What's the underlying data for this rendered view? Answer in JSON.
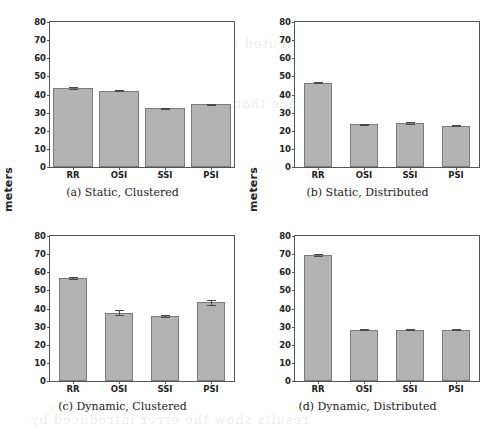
{
  "figure": {
    "ylabel": "meters",
    "yticks": [
      0,
      10,
      20,
      30,
      40,
      50,
      60,
      70,
      80
    ],
    "ylim": [
      0,
      80
    ],
    "categories": [
      "RR",
      "OSI",
      "SSI",
      "PSI"
    ],
    "bar_color": "#b3b3b3",
    "bar_edge_color": "#7a7a7a",
    "bleed_text": [
      "the distributed versions of the algorithms",
      "performance than the clustered variants",
      "results show the error introduced by"
    ]
  },
  "chart_data": [
    {
      "type": "bar",
      "panel": "a",
      "title": "(a) Static, Clustered",
      "categories": [
        "RR",
        "OSI",
        "SSI",
        "PSI"
      ],
      "values": [
        43.8,
        42.2,
        32.3,
        34.5
      ],
      "errors": [
        0.5,
        0.5,
        0.4,
        0.4
      ],
      "xlabel": "",
      "ylabel": "meters",
      "ylim": [
        0,
        80
      ],
      "yticks": [
        0,
        10,
        20,
        30,
        40,
        50,
        60,
        70,
        80
      ],
      "grid": false,
      "legend": "none",
      "bar_width_fraction": 0.85
    },
    {
      "type": "bar",
      "panel": "b",
      "title": "(b) Static, Distributed",
      "categories": [
        "RR",
        "OSI",
        "SSI",
        "PSI"
      ],
      "values": [
        46.5,
        23.8,
        24.3,
        22.9
      ],
      "errors": [
        0.3,
        0.2,
        0.3,
        0.2
      ],
      "xlabel": "",
      "ylabel": "meters",
      "ylim": [
        0,
        80
      ],
      "yticks": [
        0,
        10,
        20,
        30,
        40,
        50,
        60,
        70,
        80
      ],
      "grid": false,
      "legend": "none",
      "bar_width_fraction": 0.62
    },
    {
      "type": "bar",
      "panel": "c",
      "title": "(c) Dynamic, Clustered",
      "categories": [
        "RR",
        "OSI",
        "SSI",
        "PSI"
      ],
      "values": [
        56.8,
        37.7,
        36.0,
        43.4
      ],
      "errors": [
        0.5,
        1.5,
        0.5,
        1.3
      ],
      "xlabel": "",
      "ylabel": "meters",
      "ylim": [
        0,
        80
      ],
      "yticks": [
        0,
        10,
        20,
        30,
        40,
        50,
        60,
        70,
        80
      ],
      "grid": false,
      "legend": "none",
      "bar_width_fraction": 0.62
    },
    {
      "type": "bar",
      "panel": "d",
      "title": "(d) Dynamic, Distributed",
      "categories": [
        "RR",
        "OSI",
        "SSI",
        "PSI"
      ],
      "values": [
        69.6,
        28.3,
        28.3,
        28.3
      ],
      "errors": [
        0.6,
        0.2,
        0.2,
        0.2
      ],
      "xlabel": "",
      "ylabel": "meters",
      "ylim": [
        0,
        80
      ],
      "yticks": [
        0,
        10,
        20,
        30,
        40,
        50,
        60,
        70,
        80
      ],
      "grid": false,
      "legend": "none",
      "bar_width_fraction": 0.62
    }
  ]
}
